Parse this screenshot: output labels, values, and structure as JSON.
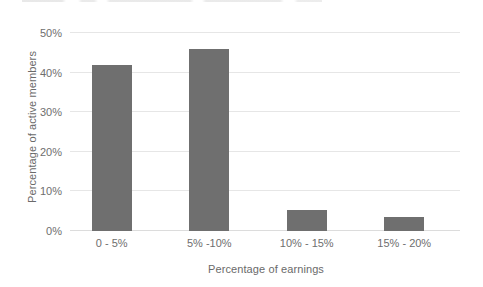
{
  "chart_data": {
    "type": "bar",
    "title": "",
    "subtitle": "",
    "xlabel": "Percentage of earnings",
    "ylabel": "Percentage of active members",
    "categories": [
      "0 - 5%",
      "5% -10%",
      "10% - 15%",
      "15% - 20%"
    ],
    "values": [
      42,
      46,
      5.3,
      3.5
    ],
    "value_labels": [
      "",
      "",
      "",
      ""
    ],
    "ylim": [
      0,
      50
    ],
    "yticks": [
      0,
      10,
      20,
      30,
      40,
      50
    ],
    "ytick_labels": [
      "0%",
      "10%",
      "20%",
      "30%",
      "40%",
      "50%"
    ],
    "grid": true,
    "grid_axis": "y",
    "legend": false,
    "legend_position": "none",
    "series": [
      {
        "name": "Percentage of active members",
        "values": [
          42,
          46,
          5.3,
          3.5
        ]
      }
    ]
  },
  "style": {
    "bar_color": "#6f6f6f",
    "gridline_color": "#e6e6e6",
    "baseline_color": "#dcdcdc",
    "background_color": "#ffffff",
    "tick_label_color": "#6e6e6e",
    "axis_title_color": "#6a6a6a"
  }
}
